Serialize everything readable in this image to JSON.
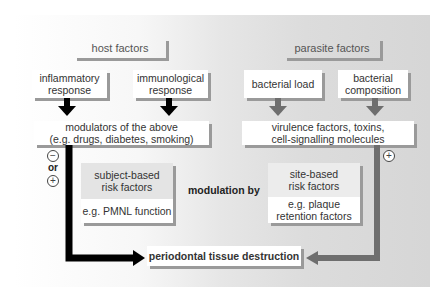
{
  "host": {
    "header": "host factors",
    "inflammatory": "inflammatory response",
    "inflammatory_l1": "inflammatory",
    "inflammatory_l2": "response",
    "immunological_l1": "immunological",
    "immunological_l2": "response",
    "modulators_l1": "modulators of the above",
    "modulators_l2": "(e.g. drugs, diabetes, smoking)",
    "subject_l1": "subject-based",
    "subject_l2": "risk factors",
    "subject_example": "e.g. PMNL function",
    "minus_symbol": "−",
    "or_label": "or",
    "plus_symbol": "+"
  },
  "parasite": {
    "header": "parasite factors",
    "load": "bacterial load",
    "composition_l1": "bacterial",
    "composition_l2": "composition",
    "virulence_l1": "virulence factors, toxins,",
    "virulence_l2": "cell-signalling molecules",
    "site_l1": "site-based",
    "site_l2": "risk factors",
    "site_example_l1": "e.g. plaque",
    "site_example_l2": "retention factors",
    "plus_symbol": "+"
  },
  "center": {
    "modulation": "modulation by",
    "outcome": "periodontal tissue destruction"
  },
  "colors": {
    "host_arrow": "#000000",
    "parasite_arrow": "#6e6e6e",
    "shadow": "#9a9a9a"
  }
}
